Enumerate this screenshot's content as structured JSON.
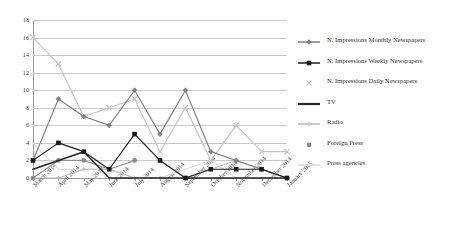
{
  "chart_data": {
    "type": "line",
    "title": "",
    "xlabel": "",
    "ylabel": "",
    "ylim": [
      0,
      18
    ],
    "yticks": [
      0,
      2,
      4,
      6,
      8,
      10,
      12,
      14,
      16,
      18
    ],
    "grid": true,
    "legend_position": "right",
    "categories": [
      "March 2014",
      "April 2014",
      "May 2014",
      "June 2014",
      "July 2014",
      "August 2014",
      "September 2014",
      "October 2014",
      "November 2014",
      "December 2014",
      "January 2015"
    ],
    "series": [
      {
        "name": "N. Impressions Monthly Newspapers",
        "color": "#7f7f7f",
        "marker": "diamond",
        "values": [
          2,
          9,
          7,
          6,
          10,
          5,
          10,
          3,
          2,
          1,
          0
        ]
      },
      {
        "name": "N. Impressions Weekly Newspapers",
        "color": "#1a1a1a",
        "marker": "square",
        "values": [
          2,
          4,
          3,
          1,
          5,
          2,
          0,
          1,
          1,
          1,
          0
        ]
      },
      {
        "name": "N. Impressions Daily Newspapers",
        "color": "#c4c4c4",
        "marker": "cross",
        "values": [
          16,
          13,
          7,
          8,
          9,
          3,
          8,
          2,
          6,
          3,
          3
        ]
      },
      {
        "name": "TV",
        "color": "#262626",
        "marker": "none",
        "values": [
          1,
          2,
          3,
          0,
          0,
          0,
          0,
          0,
          0,
          0,
          0
        ]
      },
      {
        "name": "Radio",
        "color": "#bdbdbd",
        "marker": "plus",
        "values": [
          0,
          0,
          1,
          1,
          0,
          0,
          0,
          1,
          2,
          1,
          0
        ]
      },
      {
        "name": "Foreign Press",
        "color": "#8c8c8c",
        "marker": "circle",
        "values": [
          0,
          2,
          2,
          1,
          2,
          null,
          null,
          null,
          null,
          null,
          null
        ]
      },
      {
        "name": "Press agencies",
        "color": "#d8d8d8",
        "marker": "none",
        "values": [
          4,
          1,
          1,
          1,
          0,
          0,
          1,
          2,
          0,
          0,
          0
        ]
      }
    ]
  },
  "legend": {
    "items": [
      {
        "label": "N. Impressions Monthly Newspapers",
        "key": "line-diamond-marker"
      },
      {
        "label": "N. Impressions Weekly Newspapers",
        "key": "line-square-marker"
      },
      {
        "label": "N. Impressions Daily Newspapers",
        "key": "cross-marker"
      },
      {
        "label": "TV",
        "key": "thick-line"
      },
      {
        "label": "Radio",
        "key": "line-plus-marker"
      },
      {
        "label": "Foreign Press",
        "key": "circle-marker"
      },
      {
        "label": "Press agencies",
        "key": "plain-line"
      }
    ]
  }
}
